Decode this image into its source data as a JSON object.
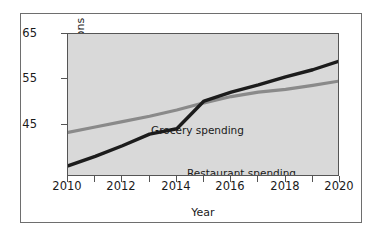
{
  "chart_data": {
    "type": "line",
    "title": "",
    "xlabel": "Year",
    "ylabel": "Spending in Billions",
    "xlim": [
      2010,
      2020
    ],
    "ylim": [
      33,
      65
    ],
    "grid": false,
    "legend_position": "inline-annotation",
    "x": [
      2010,
      2011,
      2012,
      2013,
      2014,
      2015,
      2016,
      2017,
      2018,
      2019,
      2020
    ],
    "y_ticks": [
      45,
      55,
      65
    ],
    "y_tick_labels": [
      "45",
      "55",
      "65"
    ],
    "x_ticks": [
      2010,
      2011,
      2012,
      2013,
      2014,
      2015,
      2016,
      2017,
      2018,
      2019,
      2020
    ],
    "x_tick_labels": [
      "2010",
      "2012",
      "2014",
      "2016",
      "2018",
      "2020"
    ],
    "series": [
      {
        "name": "Grocery spending",
        "color": "#8a8a8a",
        "values": [
          43.0,
          44.2,
          45.4,
          46.6,
          48.0,
          49.6,
          51.0,
          52.0,
          52.6,
          53.5,
          54.5
        ]
      },
      {
        "name": "Restaurant spending",
        "color": "#1c1c1c",
        "values": [
          35.5,
          37.6,
          40.0,
          42.6,
          43.8,
          50.0,
          52.0,
          53.6,
          55.4,
          57.0,
          59.0
        ]
      }
    ],
    "annotations": [
      {
        "text": "Grocery spending",
        "x": 2011.0,
        "y": 51.5
      },
      {
        "text": "Restaurant spending",
        "x": 2012.3,
        "y": 42.5
      }
    ]
  },
  "colors": {
    "panel_background": "#d9d9d9",
    "page_background": "#ffffff",
    "frame_border": "#6e6e6e",
    "axis": "#555555",
    "text": "#1a1a1a",
    "grocery_line": "#8a8a8a",
    "restaurant_line": "#1c1c1c"
  }
}
